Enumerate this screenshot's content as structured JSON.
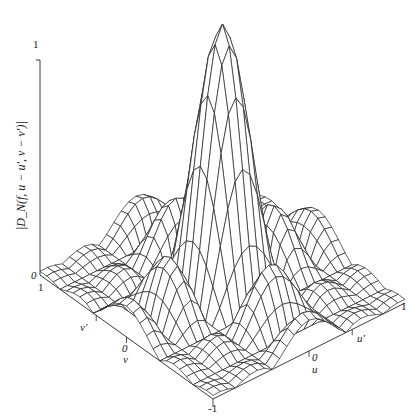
{
  "chart_data": {
    "type": "surface-wireframe",
    "title": "",
    "zlabel": "|D_N(f, u − u′, v − v′)|",
    "z_ticks": [
      "0",
      "1"
    ],
    "zlim": [
      0,
      1
    ],
    "u_axis": {
      "label": "u",
      "ticks": [
        "-1",
        "0",
        "1"
      ],
      "marker_label": "u′"
    },
    "v_axis": {
      "label": "v",
      "ticks": [
        "-1",
        "0",
        "1"
      ],
      "marker_label": "v′"
    },
    "grid_resolution": 26,
    "peak": {
      "u": 0,
      "v": 0,
      "z": 1
    }
  },
  "labels": {
    "z_one": "1",
    "z_zero": "0",
    "v_one": "1",
    "v_prime": "v′",
    "v_zero": "0",
    "v_name": "v",
    "u_zero": "0",
    "u_name": "u",
    "u_prime": "u′",
    "u_one": "1",
    "bottom_neg_one": "-1",
    "zlabel": "|D_N(f, u − u′, v − v′)|"
  }
}
